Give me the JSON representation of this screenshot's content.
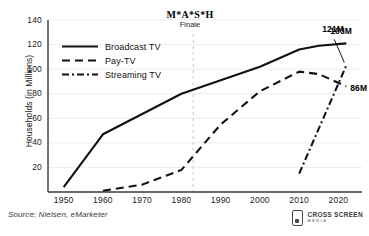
{
  "chart_data": {
    "type": "line",
    "title": "",
    "xlabel": "",
    "ylabel": "Households (in Millions)",
    "xlim": [
      1946,
      2026
    ],
    "ylim": [
      0,
      140
    ],
    "grid": true,
    "legend_position": "upper-left",
    "x_ticks": [
      "1950",
      "1960",
      "1970",
      "1980",
      "1990",
      "2000",
      "2010",
      "2020"
    ],
    "y_ticks": [
      "20",
      "40",
      "60",
      "80",
      "100",
      "120",
      "140"
    ],
    "series": [
      {
        "name": "Broadcast TV",
        "style": "solid",
        "color": "#111111",
        "x": [
          1950,
          1960,
          1980,
          2000,
          2010,
          2015,
          2022
        ],
        "values": [
          4,
          47,
          80,
          102,
          116,
          119,
          121
        ],
        "end_label": "121M"
      },
      {
        "name": "Pay-TV",
        "style": "dashed",
        "color": "#111111",
        "x": [
          1960,
          1970,
          1980,
          1990,
          2000,
          2010,
          2015,
          2022
        ],
        "values": [
          1,
          6,
          18,
          55,
          82,
          98,
          96,
          86
        ],
        "end_label": "86M"
      },
      {
        "name": "Streaming TV",
        "style": "dash-dot",
        "color": "#111111",
        "x": [
          2010,
          2022
        ],
        "values": [
          15,
          103
        ],
        "end_label": "103M"
      }
    ],
    "annotations": [
      {
        "name": "mash-finale",
        "title": "M*A*S*H",
        "subtitle": "Finale",
        "x": 1983,
        "marker": "vertical-dashed-line"
      }
    ],
    "source": "Source: Nielsen, eMarketer"
  },
  "legend": {
    "items": [
      {
        "label": "Broadcast TV"
      },
      {
        "label": "Pay-TV"
      },
      {
        "label": "Streaming TV"
      }
    ]
  },
  "logo": {
    "name": "CROSS SCREEN",
    "sub": "MEDIA"
  }
}
